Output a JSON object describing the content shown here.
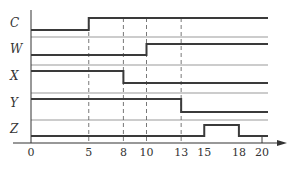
{
  "diagram": {
    "type": "timing-diagram",
    "x_axis": {
      "ticks": [
        0,
        5,
        8,
        10,
        13,
        15,
        18,
        20
      ],
      "tick_labels": [
        "0",
        "5",
        "8",
        "10",
        "13",
        "15",
        "18",
        "20"
      ],
      "has_arrow": true
    },
    "signals": [
      {
        "name": "C",
        "initial": 0,
        "transitions": [
          {
            "t": 5,
            "to": 1
          }
        ]
      },
      {
        "name": "W",
        "initial": 0,
        "transitions": [
          {
            "t": 10,
            "to": 1
          }
        ]
      },
      {
        "name": "X",
        "initial": 1,
        "transitions": [
          {
            "t": 8,
            "to": 0
          }
        ]
      },
      {
        "name": "Y",
        "initial": 1,
        "transitions": [
          {
            "t": 13,
            "to": 0
          }
        ]
      },
      {
        "name": "Z",
        "initial": 0,
        "transitions": [
          {
            "t": 15,
            "to": 1
          },
          {
            "t": 18,
            "to": 0
          }
        ]
      }
    ],
    "dashed_markers": [
      5,
      8,
      10,
      13
    ],
    "end_time": 20,
    "colors": {
      "signal": "#3a3a3a",
      "separator": "#9a9a9a",
      "axis": "#333333",
      "dashed": "#555555"
    }
  }
}
